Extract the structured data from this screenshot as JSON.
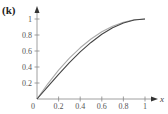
{
  "panel_label": "(k)",
  "chart_data": {
    "type": "line",
    "title": "",
    "xlabel": "x",
    "ylabel": "",
    "xlim": [
      0,
      1
    ],
    "ylim": [
      0,
      1
    ],
    "grid": false,
    "x_ticks": [
      "0.2",
      "0.4",
      "0.6",
      "0.8",
      "1"
    ],
    "y_ticks": [
      "0.2",
      "0.4",
      "0.6",
      "0.8",
      "1"
    ],
    "origin_label": "0",
    "x": [
      0,
      0.1,
      0.2,
      0.3,
      0.4,
      0.5,
      0.6,
      0.7,
      0.8,
      0.9,
      1.0
    ],
    "series": [
      {
        "name": "curve-dark",
        "color": "#444444",
        "values": [
          0,
          0.156,
          0.309,
          0.454,
          0.588,
          0.707,
          0.809,
          0.891,
          0.951,
          0.988,
          1.0
        ]
      },
      {
        "name": "curve-light",
        "color": "#aaaaaa",
        "values": [
          0,
          0.19,
          0.36,
          0.51,
          0.64,
          0.75,
          0.84,
          0.91,
          0.96,
          0.99,
          1.0
        ]
      }
    ]
  }
}
